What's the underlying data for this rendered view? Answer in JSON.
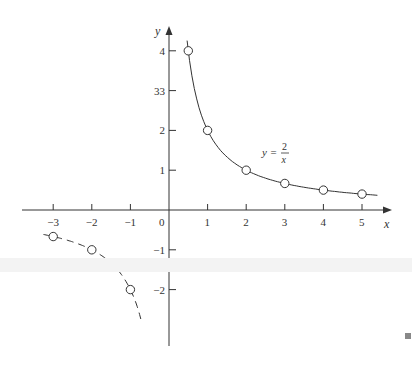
{
  "chart_data": {
    "type": "line",
    "title": "",
    "xlabel": "x",
    "ylabel": "y",
    "curve_label": {
      "lhs": "y =",
      "numerator": "2",
      "denominator": "x"
    },
    "xlim": [
      -3.8,
      5.6
    ],
    "ylim": [
      -3.4,
      4.4
    ],
    "grid": false,
    "x_ticks": [
      -3,
      -2,
      -1,
      0,
      1,
      2,
      3,
      4,
      5
    ],
    "x_tick_labels": [
      "−3",
      "−2",
      "−1",
      "0",
      "1",
      "2",
      "3",
      "4",
      "5"
    ],
    "y_ticks": [
      4,
      3,
      2,
      1,
      -1,
      -2
    ],
    "y_tick_labels": [
      "4",
      "33",
      "2",
      "1",
      "−1",
      "−2"
    ],
    "series": [
      {
        "name": "y = 2/x (x > 0)",
        "style": "solid",
        "points": [
          [
            0.5,
            4
          ],
          [
            1,
            2
          ],
          [
            2,
            1
          ],
          [
            3,
            0.667
          ],
          [
            4,
            0.5
          ],
          [
            5,
            0.4
          ]
        ]
      },
      {
        "name": "y = 2/x (x < 0)",
        "style": "dashed",
        "points": [
          [
            -3,
            -0.667
          ],
          [
            -2,
            -1
          ],
          [
            -1,
            -2
          ]
        ]
      }
    ]
  },
  "colors": {
    "ink": "#333333",
    "marker_fill": "#ffffff",
    "scan_band": "#f3f3f3",
    "corner_square": "#888888"
  }
}
